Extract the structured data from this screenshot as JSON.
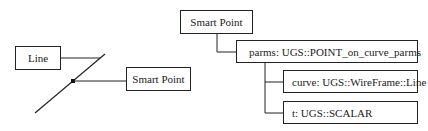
{
  "diagram": {
    "left_figure": {
      "line_label": "Line",
      "point_label": "Smart Point"
    },
    "tree": {
      "root": "Smart Point",
      "child": "parms: UGS::POINT_on_curve_parms",
      "grandchildren": [
        "curve: UGS::WireFrame::Line",
        "t: UGS::SCALAR"
      ]
    },
    "colors": {
      "stroke": "#222222",
      "background": "#ffffff"
    }
  }
}
